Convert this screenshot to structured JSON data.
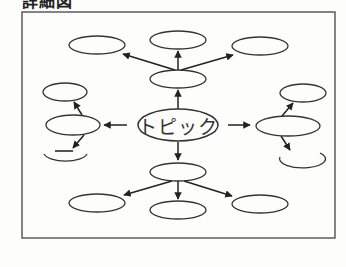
{
  "heading": "詳細図",
  "diagram": {
    "type": "concept-map",
    "frame": {
      "x": 22,
      "y": 12,
      "width": 313,
      "height": 226
    },
    "stroke_color": "#333333",
    "central_topic": {
      "label": "トピック",
      "cx": 178,
      "cy": 125,
      "rx": 40,
      "ry": 16
    },
    "nodes": [
      {
        "id": "top-left",
        "label": "",
        "cx": 97,
        "cy": 45,
        "rx": 28,
        "ry": 9
      },
      {
        "id": "top-center",
        "label": "",
        "cx": 178,
        "cy": 40,
        "rx": 28,
        "ry": 9
      },
      {
        "id": "top-right",
        "label": "",
        "cx": 260,
        "cy": 46,
        "rx": 28,
        "ry": 9
      },
      {
        "id": "upper-middle",
        "label": "",
        "cx": 178,
        "cy": 79,
        "rx": 28,
        "ry": 9
      },
      {
        "id": "left-top",
        "label": "",
        "cx": 65,
        "cy": 92,
        "rx": 22,
        "ry": 9
      },
      {
        "id": "left-middle",
        "label": "",
        "cx": 73,
        "cy": 125,
        "rx": 27,
        "ry": 10
      },
      {
        "id": "left-bottom",
        "label": "",
        "cx": 65,
        "cy": 158,
        "rx": 22,
        "ry": 9,
        "broken": true
      },
      {
        "id": "right-top",
        "label": "",
        "cx": 303,
        "cy": 93,
        "rx": 23,
        "ry": 9
      },
      {
        "id": "right-middle",
        "label": "",
        "cx": 288,
        "cy": 126,
        "rx": 32,
        "ry": 10
      },
      {
        "id": "right-bottom",
        "label": "",
        "cx": 303,
        "cy": 160,
        "rx": 23,
        "ry": 9,
        "broken": true
      },
      {
        "id": "lower-middle",
        "label": "",
        "cx": 178,
        "cy": 172,
        "rx": 28,
        "ry": 9
      },
      {
        "id": "bottom-left",
        "label": "",
        "cx": 97,
        "cy": 203,
        "rx": 28,
        "ry": 9
      },
      {
        "id": "bottom-center",
        "label": "",
        "cx": 178,
        "cy": 210,
        "rx": 28,
        "ry": 9
      },
      {
        "id": "bottom-right",
        "label": "",
        "cx": 260,
        "cy": 204,
        "rx": 28,
        "ry": 9
      }
    ],
    "edges": [
      {
        "from": "topic",
        "to": "upper-middle"
      },
      {
        "from": "upper-middle",
        "to": "top-left"
      },
      {
        "from": "upper-middle",
        "to": "top-center"
      },
      {
        "from": "upper-middle",
        "to": "top-right"
      },
      {
        "from": "topic",
        "to": "left-middle"
      },
      {
        "from": "left-middle",
        "to": "left-top"
      },
      {
        "from": "left-middle",
        "to": "left-bottom"
      },
      {
        "from": "topic",
        "to": "right-middle"
      },
      {
        "from": "right-middle",
        "to": "right-top"
      },
      {
        "from": "right-middle",
        "to": "right-bottom"
      },
      {
        "from": "topic",
        "to": "lower-middle"
      },
      {
        "from": "lower-middle",
        "to": "bottom-left"
      },
      {
        "from": "lower-middle",
        "to": "bottom-center"
      },
      {
        "from": "lower-middle",
        "to": "bottom-right"
      }
    ]
  }
}
